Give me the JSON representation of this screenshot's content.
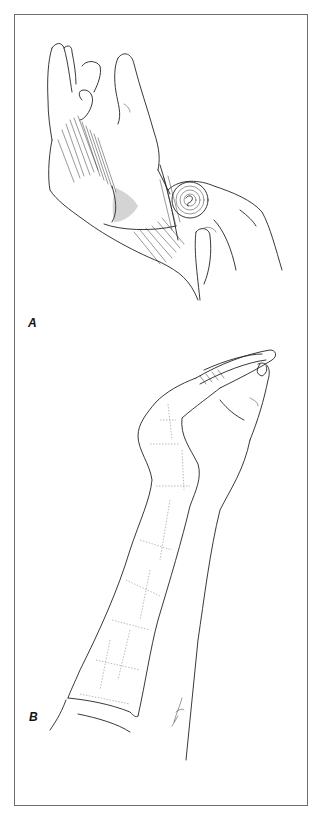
{
  "figure": {
    "panels": [
      {
        "id": "A",
        "label": "A",
        "subject": "hand-with-bandage-roll",
        "description": "Line drawing of a hand being wrapped with a bandage; a second hand holds a rolled bandage at the wrist"
      },
      {
        "id": "B",
        "label": "B",
        "subject": "forearm-cast",
        "description": "Line drawing of a forearm and hand with a cast extending from forearm over the wrist and palm"
      }
    ],
    "colors": {
      "border": "#6e6e6e",
      "ink": "#222222",
      "background": "#ffffff"
    }
  }
}
